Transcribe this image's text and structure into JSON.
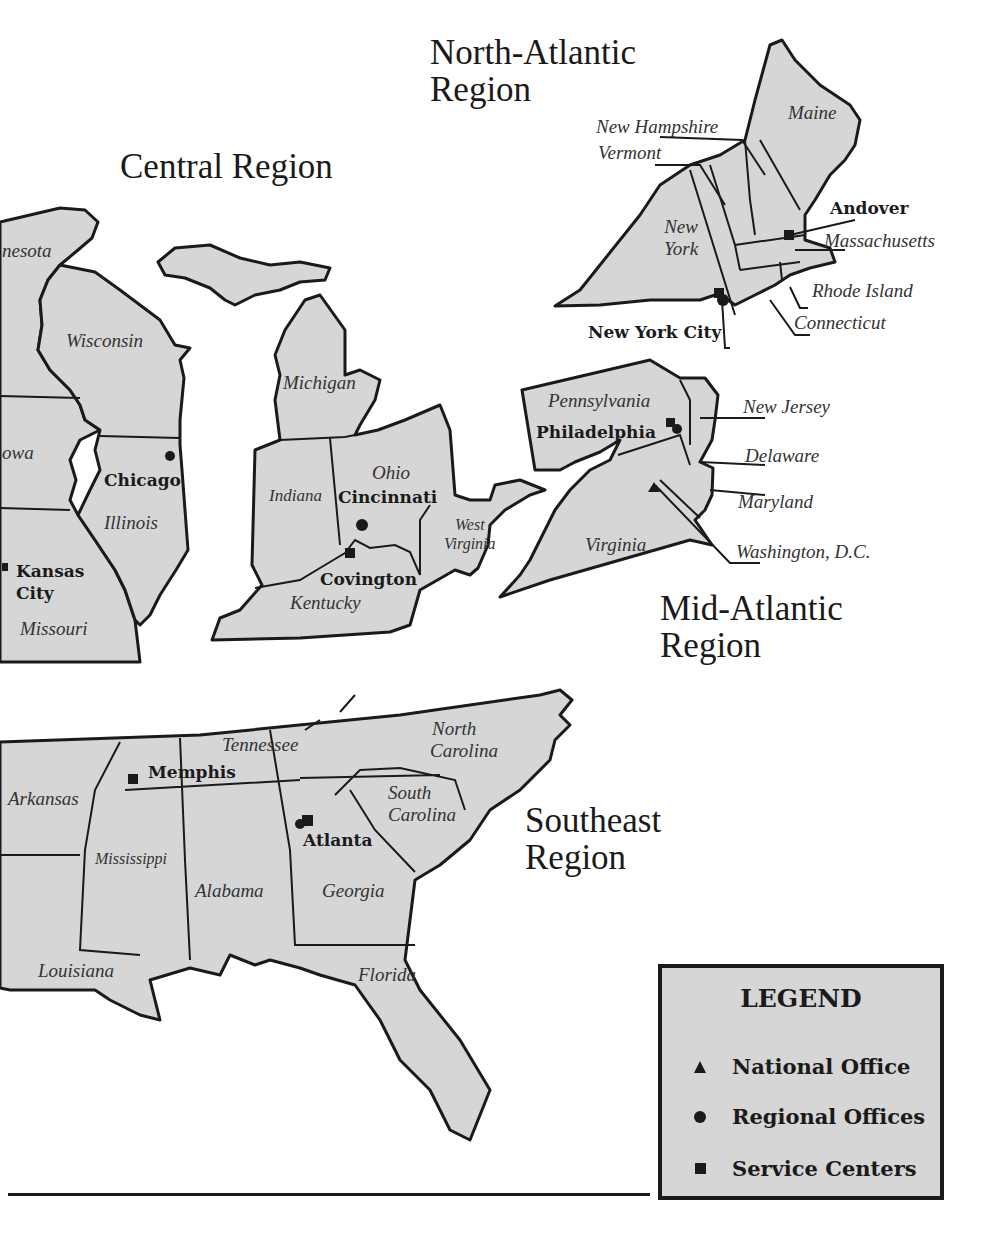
{
  "regions": {
    "central": "Central Region",
    "north_atlantic_line1": "North-Atlantic",
    "north_atlantic_line2": "Region",
    "mid_atlantic_line1": "Mid-Atlantic",
    "mid_atlantic_line2": "Region",
    "southeast_line1": "Southeast",
    "southeast_line2": "Region"
  },
  "states": {
    "minnesota": "nesota",
    "wisconsin": "Wisconsin",
    "iowa": "owa",
    "illinois": "Illinois",
    "missouri": "Missouri",
    "michigan": "Michigan",
    "indiana": "Indiana",
    "ohio": "Ohio",
    "west_virginia_1": "West",
    "west_virginia_2": "Virginia",
    "kentucky": "Kentucky",
    "new_hampshire": "New Hampshire",
    "vermont": "Vermont",
    "maine": "Maine",
    "new_york_1": "New",
    "new_york_2": "York",
    "massachusetts": "Massachusetts",
    "rhode_island": "Rhode Island",
    "connecticut": "Connecticut",
    "pennsylvania": "Pennsylvania",
    "new_jersey": "New Jersey",
    "delaware": "Delaware",
    "maryland": "Maryland",
    "virginia": "Virginia",
    "washington_dc": "Washington, D.C.",
    "arkansas": "Arkansas",
    "tennessee": "Tennessee",
    "north_carolina_1": "North",
    "north_carolina_2": "Carolina",
    "south_carolina_1": "South",
    "south_carolina_2": "Carolina",
    "mississippi": "Mississippi",
    "alabama": "Alabama",
    "georgia": "Georgia",
    "louisiana": "Louisiana",
    "florida": "Florida"
  },
  "cities": {
    "chicago": "Chicago",
    "kansas_city_1": "Kansas",
    "kansas_city_2": "City",
    "cincinnati": "Cincinnati",
    "covington": "Covington",
    "andover": "Andover",
    "new_york_city": "New York City",
    "philadelphia": "Philadelphia",
    "memphis": "Memphis",
    "atlanta": "Atlanta"
  },
  "legend": {
    "title": "LEGEND",
    "items": [
      {
        "symbol": "triangle",
        "label": "National Office"
      },
      {
        "symbol": "circle",
        "label": "Regional Offices"
      },
      {
        "symbol": "square",
        "label": "Service Centers"
      }
    ]
  },
  "colors": {
    "land": "#d6d6d6",
    "ink": "#1a1a1a",
    "background": "#ffffff"
  }
}
